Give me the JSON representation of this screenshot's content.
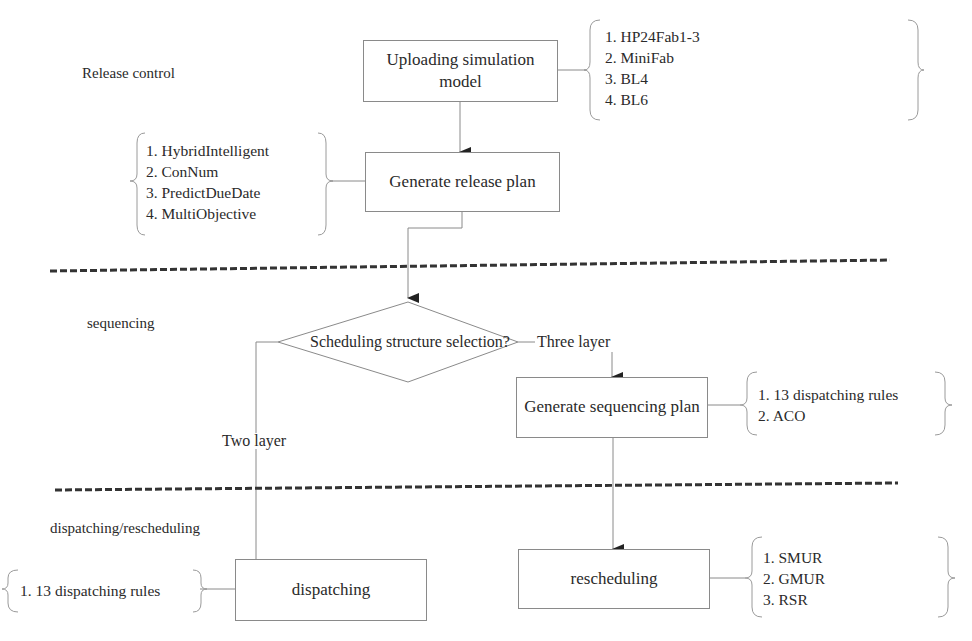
{
  "sections": {
    "release_control": "Release control",
    "sequencing": "sequencing",
    "dispatching_rescheduling": "dispatching/rescheduling"
  },
  "nodes": {
    "upload_model": "Uploading simulation model",
    "generate_release_plan": "Generate release plan",
    "decision": "Scheduling structure selection?",
    "generate_sequencing_plan": "Generate sequencing plan",
    "dispatching": "dispatching",
    "rescheduling": "rescheduling"
  },
  "edges": {
    "three_layer": "Three layer",
    "two_layer": "Two layer"
  },
  "lists": {
    "models": [
      "1.  HP24Fab1-3",
      "2.  MiniFab",
      "3.  BL4",
      "4.  BL6"
    ],
    "release_methods": [
      "1.  HybridIntelligent",
      "2.  ConNum",
      "3.  PredictDueDate",
      "4.  MultiObjective"
    ],
    "sequencing_methods": [
      "1.  13 dispatching rules",
      "2.  ACO"
    ],
    "dispatching_methods": [
      "1.  13 dispatching rules"
    ],
    "rescheduling_methods": [
      "1.  SMUR",
      "2.  GMUR",
      "3.  RSR"
    ]
  },
  "colors": {
    "line": "#8a8a8a",
    "divider": "#333333",
    "text": "#2a2a2a"
  }
}
